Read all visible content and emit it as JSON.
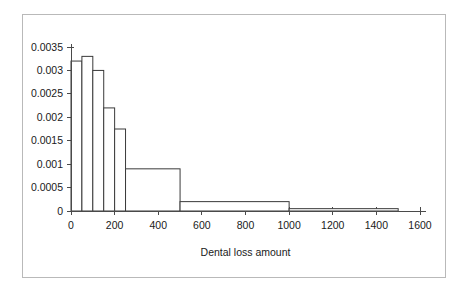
{
  "figure": {
    "background_color": "#ffffff",
    "frame_color": "#b9b9b9",
    "axis_color": "#4a4a4a",
    "bar_edge_color": "#3a3a3a",
    "bar_fill_color": "#ffffff"
  },
  "chart_data": {
    "type": "bar",
    "title": "",
    "xlabel": "Dental loss amount",
    "ylabel": "",
    "xlim": [
      0,
      1600
    ],
    "ylim": [
      0,
      0.0035
    ],
    "grid": false,
    "legend": false,
    "x_ticks": [
      0,
      200,
      400,
      600,
      800,
      1000,
      1200,
      1400,
      1600
    ],
    "x_tick_labels": [
      "0",
      "200",
      "400",
      "600",
      "800",
      "1000",
      "1200",
      "1400",
      "1600"
    ],
    "y_ticks": [
      0,
      0.0005,
      0.001,
      0.0015,
      0.002,
      0.0025,
      0.003,
      0.0035
    ],
    "y_tick_labels": [
      "0",
      "0.0005",
      "0.001",
      "0.0015",
      "0.002",
      "0.0025",
      "0.003",
      "0.0035"
    ],
    "bin_edges": [
      0,
      50,
      100,
      150,
      200,
      250,
      500,
      1000,
      1500
    ],
    "values": [
      0.0032,
      0.0033,
      0.003,
      0.0022,
      0.00175,
      0.0009,
      0.0002,
      5e-05
    ],
    "bars": [
      {
        "label": "0-50",
        "x0": 0,
        "x1": 50,
        "height": 0.0032
      },
      {
        "label": "50-100",
        "x0": 50,
        "x1": 100,
        "height": 0.0033
      },
      {
        "label": "100-150",
        "x0": 100,
        "x1": 150,
        "height": 0.003
      },
      {
        "label": "150-200",
        "x0": 150,
        "x1": 200,
        "height": 0.0022
      },
      {
        "label": "200-250",
        "x0": 200,
        "x1": 250,
        "height": 0.00175
      },
      {
        "label": "250-500",
        "x0": 250,
        "x1": 500,
        "height": 0.0009
      },
      {
        "label": "500-1000",
        "x0": 500,
        "x1": 1000,
        "height": 0.0002
      },
      {
        "label": "1000-1500",
        "x0": 1000,
        "x1": 1500,
        "height": 5e-05
      }
    ]
  }
}
